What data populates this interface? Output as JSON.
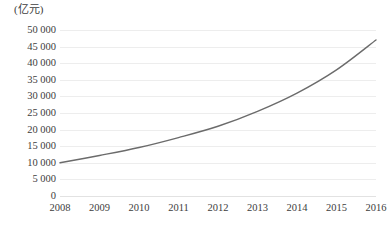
{
  "chart_data": {
    "type": "line",
    "title": "",
    "subtitle": "",
    "unit_label": "(亿元)",
    "xlabel": "",
    "ylabel": "",
    "categories": [
      "2008",
      "2009",
      "2010",
      "2011",
      "2012",
      "2013",
      "2014",
      "2015",
      "2016"
    ],
    "x": [
      2008,
      2009,
      2010,
      2011,
      2012,
      2013,
      2014,
      2015,
      2016
    ],
    "series": [
      {
        "name": "",
        "values": [
          10000,
          12200,
          14600,
          17600,
          21000,
          25500,
          31000,
          38000,
          47000
        ]
      }
    ],
    "ylim": [
      0,
      50000
    ],
    "ytick_step": 5000,
    "ytick_labels": [
      "50 000",
      "45 000",
      "40 000",
      "35 000",
      "30 000",
      "25 000",
      "20 000",
      "15 000",
      "10 000",
      "5 000",
      "0"
    ],
    "ytick_values": [
      50000,
      45000,
      40000,
      35000,
      30000,
      25000,
      20000,
      15000,
      10000,
      5000,
      0
    ],
    "grid": true,
    "grid_axis": "y",
    "legend": false,
    "legend_position": "none",
    "colors": {
      "line": "#6b6b6b",
      "grid": "#ededed",
      "baseline": "#e2e2e2",
      "text": "#3d3d3d",
      "background": "#ffffff"
    },
    "line_width": 1.4,
    "markers": false
  }
}
